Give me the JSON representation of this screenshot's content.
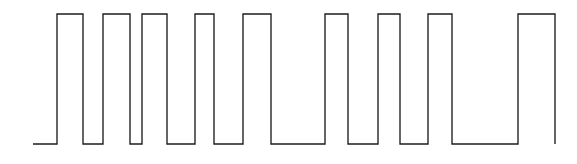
{
  "figure": {
    "kind": "waveform-trace",
    "width": 577,
    "height": 164,
    "background_color": "#ffffff",
    "trace_color": "#1c1c1c",
    "trace_width_px": 1.35
  },
  "chart_data": {
    "type": "line",
    "title": "",
    "subtitle": "",
    "xlabel": "",
    "ylabel": "",
    "legend": [],
    "grid": false,
    "axis_visible": false,
    "tick_labels_x": [],
    "tick_labels_y": [],
    "xlim": [
      33,
      555
    ],
    "ylim": [
      0,
      1
    ],
    "y_levels": {
      "low": 0,
      "high": 1,
      "low_px": 144,
      "high_px": 14
    },
    "series": [
      {
        "name": "signal",
        "step": "post",
        "x": [
          33,
          57,
          83,
          103,
          130,
          142,
          167,
          195,
          214,
          243,
          271,
          325,
          348,
          378,
          400,
          428,
          452,
          518,
          555
        ],
        "y": [
          0,
          1,
          0,
          1,
          0,
          1,
          0,
          1,
          0,
          1,
          0,
          1,
          0,
          1,
          0,
          1,
          0,
          1,
          0
        ]
      }
    ],
    "pulses": [
      {
        "index": 1,
        "rise_x": 57,
        "fall_x": 83,
        "width_px": 26
      },
      {
        "index": 2,
        "rise_x": 103,
        "fall_x": 130,
        "width_px": 27
      },
      {
        "index": 3,
        "rise_x": 142,
        "fall_x": 167,
        "width_px": 25
      },
      {
        "index": 4,
        "rise_x": 195,
        "fall_x": 214,
        "width_px": 19
      },
      {
        "index": 5,
        "rise_x": 243,
        "fall_x": 271,
        "width_px": 28
      },
      {
        "index": 6,
        "rise_x": 325,
        "fall_x": 348,
        "width_px": 23
      },
      {
        "index": 7,
        "rise_x": 378,
        "fall_x": 400,
        "width_px": 22
      },
      {
        "index": 8,
        "rise_x": 428,
        "fall_x": 452,
        "width_px": 24
      }
    ],
    "lead_in": {
      "start_x": 33,
      "end_x": 57,
      "level": "low"
    },
    "lead_out": {
      "start_x": 518,
      "end_x": 555,
      "level": "low"
    },
    "path_d": "M 33 144 L 57 144 L 57 14 L 83 14 L 83 144 L 103 144 L 103 14 L 130 14 L 130 144 L 142 144 L 142 14 L 167 14 L 167 144 L 195 144 L 195 14 L 214 14 L 214 144 L 243 144 L 243 14 L 271 14 L 271 144 L 325 144 L 325 14 L 348 14 L 348 144 L 378 144 L 378 14 L 400 14 L 400 144 L 428 144 L 428 14 L 452 14 L 452 144 L 518 144 L 518 14 L 555 14 L 555 144",
    "counts": {
      "pulses": 8,
      "rising_edges": 8,
      "falling_edges": 8
    }
  }
}
